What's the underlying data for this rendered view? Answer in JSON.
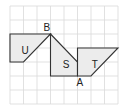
{
  "grid": {
    "cols": 8,
    "rows": 7,
    "origin_x": 10,
    "origin_y": 6,
    "cell_w": 13.5,
    "cell_h": 14,
    "line_color": "#d9d9d9"
  },
  "shape_fill": "#ececec",
  "stroke_color": "#333333",
  "shapes": [
    {
      "name": "U",
      "label": "U",
      "points": [
        [
          0,
          2
        ],
        [
          3,
          2
        ],
        [
          1,
          4
        ],
        [
          0,
          4
        ]
      ],
      "label_pos": [
        0.85,
        3.15
      ]
    },
    {
      "name": "S",
      "label": "S",
      "points": [
        [
          3,
          2
        ],
        [
          5,
          4
        ],
        [
          5,
          5
        ],
        [
          3,
          5
        ]
      ],
      "label_pos": [
        3.9,
        4.15
      ]
    },
    {
      "name": "T",
      "label": "T",
      "points": [
        [
          5,
          3
        ],
        [
          8,
          3
        ],
        [
          6,
          5
        ],
        [
          5,
          5
        ]
      ],
      "label_pos": [
        6.05,
        4.15
      ]
    }
  ],
  "points": [
    {
      "name": "B",
      "label": "B",
      "at": [
        3,
        2
      ],
      "label_offset": [
        -7,
        -3
      ]
    },
    {
      "name": "A",
      "label": "A",
      "at": [
        5,
        5
      ],
      "label_offset": [
        -1,
        10
      ]
    }
  ]
}
